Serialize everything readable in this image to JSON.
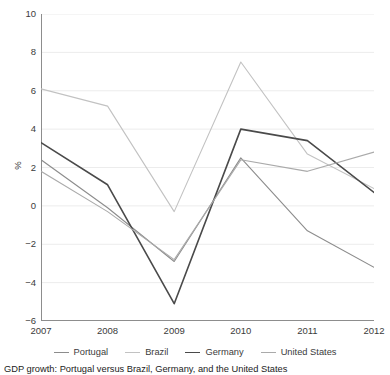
{
  "chart_data": {
    "type": "line",
    "title": "",
    "xlabel": "",
    "ylabel": "%",
    "x": [
      2007,
      2008,
      2009,
      2010,
      2011,
      2012
    ],
    "xtick_labels": [
      "2007",
      "2008",
      "2009",
      "2010",
      "2011",
      "2012"
    ],
    "ytick_labels": [
      "10",
      "8",
      "6",
      "4",
      "2",
      "0",
      "−2",
      "−4",
      "−6"
    ],
    "yticks": [
      10,
      8,
      6,
      4,
      2,
      0,
      -2,
      -4,
      -6
    ],
    "ylim": [
      -6,
      10
    ],
    "xlim": [
      2007,
      2012
    ],
    "grid": "horizontal",
    "legend_position": "below",
    "series": [
      {
        "name": "Portugal",
        "color": "#8c8c8c",
        "values": [
          2.4,
          -0.1,
          -2.9,
          2.5,
          -1.3,
          -3.2
        ]
      },
      {
        "name": "Brazil",
        "color": "#c2c2c2",
        "values": [
          6.1,
          5.2,
          -0.3,
          7.5,
          2.7,
          0.9
        ]
      },
      {
        "name": "Germany",
        "color": "#4a4a4a",
        "values": [
          3.3,
          1.1,
          -5.1,
          4.0,
          3.4,
          0.7
        ]
      },
      {
        "name": "United States",
        "color": "#aaaaaa",
        "values": [
          1.8,
          -0.3,
          -2.8,
          2.4,
          1.8,
          2.8
        ]
      }
    ]
  },
  "axis": {
    "y_label": "%"
  },
  "caption": {
    "text": "GDP growth: Portugal versus Brazil, Germany, and the United States"
  }
}
